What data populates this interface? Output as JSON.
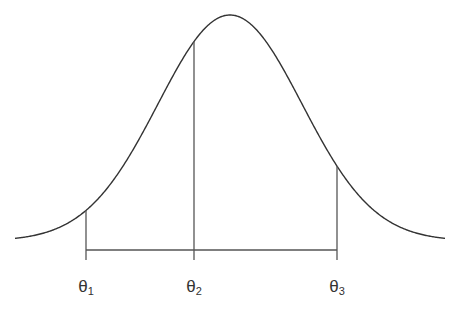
{
  "diagram": {
    "type": "normal-distribution-curve",
    "curve": {
      "mean_x": 230,
      "sigma_px": 72,
      "baseline_y": 241,
      "peak_y": 15,
      "x_start": 15,
      "x_end": 445,
      "stroke": "#333333"
    },
    "bracket": {
      "y": 250,
      "x_start": 86,
      "x_end": 337,
      "stroke": "#555555"
    },
    "markers": [
      {
        "id": "theta1",
        "symbol": "θ",
        "subscript": "1",
        "x": 86
      },
      {
        "id": "theta2",
        "symbol": "θ",
        "subscript": "2",
        "x": 194
      },
      {
        "id": "theta3",
        "symbol": "θ",
        "subscript": "3",
        "x": 337
      }
    ]
  }
}
